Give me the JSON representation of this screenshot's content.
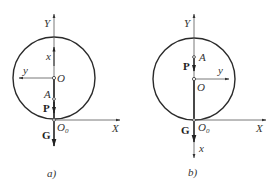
{
  "figure": {
    "panels": [
      {
        "id": "a",
        "caption": "a)",
        "labels": {
          "global_y": "Y",
          "global_x": "X",
          "local_x": "x",
          "local_y": "y",
          "center": "O",
          "point_a": "A",
          "force_p": "P",
          "force_g": "G",
          "origin": "O",
          "origin_sub": "0"
        },
        "local_x_direction": "up",
        "local_y_direction": "left"
      },
      {
        "id": "b",
        "caption": "b)",
        "labels": {
          "global_y": "Y",
          "global_x": "X",
          "local_x": "x",
          "local_y": "y",
          "center": "O",
          "point_a": "A",
          "force_p": "P",
          "force_g": "G",
          "origin": "O",
          "origin_sub": "0"
        },
        "local_x_direction": "down",
        "local_y_direction": "right"
      }
    ],
    "colors": {
      "stroke": "#2a2a2a",
      "thin_stroke": "#555555",
      "text": "#333333"
    }
  }
}
